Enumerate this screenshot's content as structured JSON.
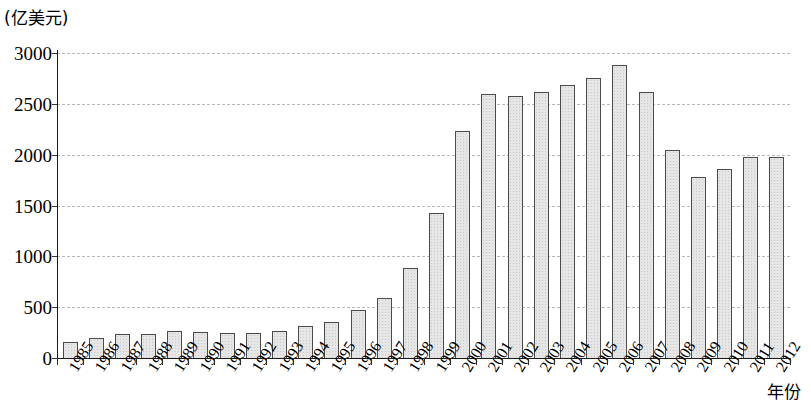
{
  "chart_data": {
    "type": "bar",
    "title": "",
    "subtitle": "",
    "unit_label": "(亿美元)",
    "xlabel": "年份",
    "ylabel": "",
    "ylim": [
      0,
      3000
    ],
    "ytick_step": 500,
    "yticks": [
      "0",
      "500",
      "1000",
      "1500",
      "2000",
      "2500",
      "3000"
    ],
    "grid": true,
    "legend": null,
    "categories": [
      "1985",
      "1986",
      "1987",
      "1988",
      "1989",
      "1990",
      "1991",
      "1992",
      "1993",
      "1994",
      "1995",
      "1996",
      "1997",
      "1998",
      "1999",
      "2000",
      "2001",
      "2002",
      "2003",
      "2004",
      "2005",
      "2006",
      "2007",
      "2008",
      "2009",
      "2010",
      "2011",
      "2012"
    ],
    "values": [
      160,
      200,
      235,
      240,
      270,
      255,
      245,
      250,
      265,
      310,
      355,
      470,
      595,
      885,
      1430,
      2230,
      2595,
      2580,
      2620,
      2690,
      2750,
      2880,
      2620,
      2050,
      1780,
      1860,
      1980,
      1980
    ],
    "bar_fill_color": "#e6e6e6",
    "bar_border_color": "#4a4a4a",
    "gridline_color": "#b9b9b9",
    "axis_color": "#1a1a1a"
  }
}
